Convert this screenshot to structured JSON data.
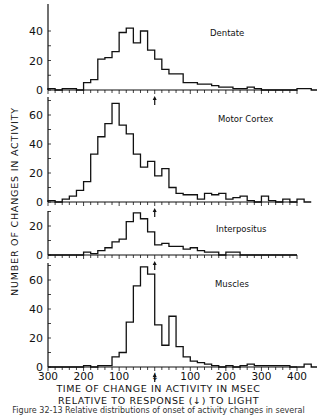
{
  "figure": {
    "ylabel": "NUMBER OF CHANGES IN ACTIVITY",
    "xlabel_line1": "TIME OF CHANGE IN ACTIVITY IN MSEC",
    "xlabel_line2": "RELATIVE TO RESPONSE (↓) TO LIGHT",
    "caption": "Figure 32-13 Relative distributions of onset of activity changes in several",
    "line_color": "#111111",
    "background": "#ffffff"
  },
  "chart_data": {
    "type": "bar",
    "title": "",
    "xlabel": "TIME OF CHANGE IN ACTIVITY IN MSEC RELATIVE TO RESPONSE (↓) TO LIGHT",
    "ylabel": "NUMBER OF CHANGES IN ACTIVITY",
    "x_tick_labels": [
      "300",
      "200",
      "100",
      "↓",
      "100",
      "200",
      "300",
      "400"
    ],
    "x_tick_values": [
      -300,
      -200,
      -100,
      0,
      100,
      200,
      300,
      400
    ],
    "xlim": [
      -300,
      400
    ],
    "bin_width_ms": 20,
    "response_marker_ms": 0,
    "grid": false,
    "panels": [
      {
        "name": "Dentate",
        "y_ticks": [
          0,
          20,
          40
        ],
        "ylim": [
          0,
          48
        ],
        "bins_start_ms": -300,
        "values": [
          1,
          0,
          1,
          1,
          0,
          5,
          7,
          21,
          22,
          26,
          39,
          42,
          32,
          40,
          27,
          21,
          14,
          11,
          11,
          5,
          5,
          4,
          4,
          3,
          2,
          2,
          1,
          1,
          2,
          1,
          0,
          0,
          0,
          0,
          0,
          1,
          1,
          0,
          0,
          0,
          0,
          0,
          0,
          0,
          0,
          0,
          0,
          0,
          0,
          0,
          0,
          0,
          0,
          0,
          0
        ]
      },
      {
        "name": "Motor Cortex",
        "y_ticks": [
          0,
          20,
          40,
          60
        ],
        "ylim": [
          0,
          75
        ],
        "bins_start_ms": -300,
        "values": [
          1,
          0,
          2,
          4,
          8,
          14,
          33,
          45,
          54,
          68,
          53,
          47,
          33,
          24,
          28,
          18,
          23,
          10,
          6,
          5,
          5,
          2,
          6,
          5,
          6,
          2,
          3,
          4,
          1,
          0,
          4,
          1,
          0,
          2,
          0,
          2,
          0
        ]
      },
      {
        "name": "Interpositus",
        "y_ticks": [
          0,
          20
        ],
        "ylim": [
          0,
          32
        ],
        "bins_start_ms": -300,
        "values": [
          0,
          0,
          0,
          0,
          0,
          2,
          1,
          3,
          5,
          9,
          11,
          23,
          29,
          25,
          16,
          7,
          8,
          6,
          6,
          4,
          5,
          3,
          2,
          2,
          0,
          2,
          2,
          0,
          0,
          0,
          0,
          0,
          0,
          0,
          0
        ]
      },
      {
        "name": "Muscles",
        "y_ticks": [
          0,
          20,
          40,
          60
        ],
        "ylim": [
          0,
          75
        ],
        "bins_start_ms": -300,
        "values": [
          0,
          0,
          0,
          0,
          0,
          1,
          0,
          1,
          1,
          7,
          10,
          31,
          56,
          69,
          64,
          29,
          15,
          35,
          14,
          7,
          4,
          3,
          2,
          1,
          0,
          1,
          0,
          1,
          2,
          1,
          1,
          1,
          1,
          1,
          0,
          0,
          2,
          0,
          0,
          0,
          0,
          0,
          0
        ]
      }
    ]
  }
}
